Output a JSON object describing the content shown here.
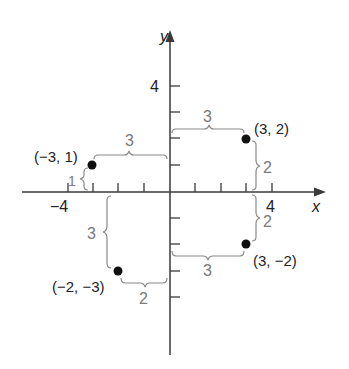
{
  "diagram": {
    "type": "coordinate-plane",
    "x_axis": {
      "label": "x",
      "tick_label_neg": "−4",
      "tick_label_pos": "4",
      "range": [
        -4,
        4
      ]
    },
    "y_axis": {
      "label": "y",
      "tick_label_pos": "4",
      "range": [
        -5,
        5
      ]
    },
    "points": [
      {
        "label": "(−3, 1)",
        "x": -3,
        "y": 1
      },
      {
        "label": "(3, 2)",
        "x": 3,
        "y": 2
      },
      {
        "label": "(−2, −3)",
        "x": -2,
        "y": -3
      },
      {
        "label": "(3, −2)",
        "x": 3,
        "y": -2
      }
    ],
    "braces": {
      "p1_horizontal": "3",
      "p1_vertical": "1",
      "p2_horizontal": "3",
      "p2_vertical": "2",
      "p3_horizontal": "2",
      "p3_vertical": "3",
      "p4_horizontal": "3",
      "p4_vertical": "2"
    },
    "colors": {
      "axis": "#3a3a3a",
      "point": "#111111",
      "brace": "#8a8a8a",
      "brace_text": "#7a7a7a",
      "label_text": "#222222"
    }
  }
}
